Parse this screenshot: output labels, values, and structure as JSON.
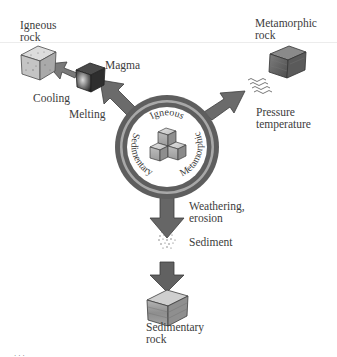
{
  "diagram": {
    "center": {
      "ring_labels": {
        "top": "Igneous",
        "left": "Sedimentary",
        "right": "Metamorphic"
      },
      "icon": "stacked-rock-cubes-icon"
    },
    "nodes": {
      "igneous_rock": {
        "line1": "Igneous",
        "line2": "rock"
      },
      "magma": {
        "label": "Magma"
      },
      "metamorphic_rock": {
        "line1": "Metamorphic",
        "line2": "rock"
      },
      "sediment": {
        "label": "Sediment"
      },
      "sedimentary_rock": {
        "line1": "Sedimentary",
        "line2": "rock"
      }
    },
    "processes": {
      "cooling": "Cooling",
      "melting": "Melting",
      "pressure_line1": "Pressure",
      "pressure_line2": "temperature",
      "weathering_line1": "Weathering,",
      "weathering_line2": "erosion"
    },
    "footer_fragment": "...",
    "colors": {
      "ring_dark": "#5e5e5e",
      "ring_light": "#a8a8a8",
      "arrow": "#6b6b6b",
      "rock_light": "#c9c9c9",
      "rock_dark": "#6f6f6f",
      "text": "#3c3c3c"
    }
  }
}
